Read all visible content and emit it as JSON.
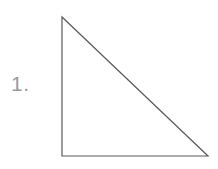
{
  "figure": {
    "label": "1.",
    "label_color": "#9a9a9a",
    "background_color": "#ffffff",
    "shape_name": "right-triangle",
    "stroke_color": "#5a5a5a",
    "stroke_width": 1.2,
    "vertices": [
      {
        "name": "apex-top-left",
        "x": 62,
        "y": 17
      },
      {
        "name": "right-angle-bottom-left",
        "x": 62,
        "y": 156
      },
      {
        "name": "bottom-right",
        "x": 208,
        "y": 156
      }
    ],
    "sides": [
      {
        "name": "vertical-leg",
        "from": "apex-top-left",
        "to": "right-angle-bottom-left"
      },
      {
        "name": "horizontal-leg",
        "from": "right-angle-bottom-left",
        "to": "bottom-right"
      },
      {
        "name": "hypotenuse",
        "from": "bottom-right",
        "to": "apex-top-left"
      }
    ],
    "polygon_points": "62,17 62,156 208,156"
  }
}
